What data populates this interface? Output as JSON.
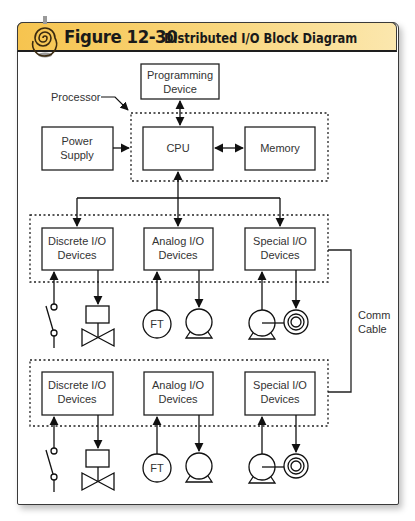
{
  "figure": {
    "number": "Figure 12-30",
    "title": "Distributed I/O Block Diagram",
    "accent_color": "#f6c44f",
    "icon": "spiral-icon"
  },
  "processor_group": {
    "label": "Processor",
    "programming_device": [
      "Programming",
      "Device"
    ],
    "power_supply": [
      "Power",
      "Supply"
    ],
    "cpu": "CPU",
    "memory": "Memory"
  },
  "io_racks": [
    {
      "discrete": [
        "Discrete I/O",
        "Devices"
      ],
      "analog": [
        "Analog I/O",
        "Devices"
      ],
      "special": [
        "Special I/O",
        "Devices"
      ],
      "flow_transmitter": "FT"
    },
    {
      "discrete": [
        "Discrete I/O",
        "Devices"
      ],
      "analog": [
        "Analog I/O",
        "Devices"
      ],
      "special": [
        "Special I/O",
        "Devices"
      ],
      "flow_transmitter": "FT"
    }
  ],
  "comm_cable": [
    "Comm",
    "Cable"
  ]
}
